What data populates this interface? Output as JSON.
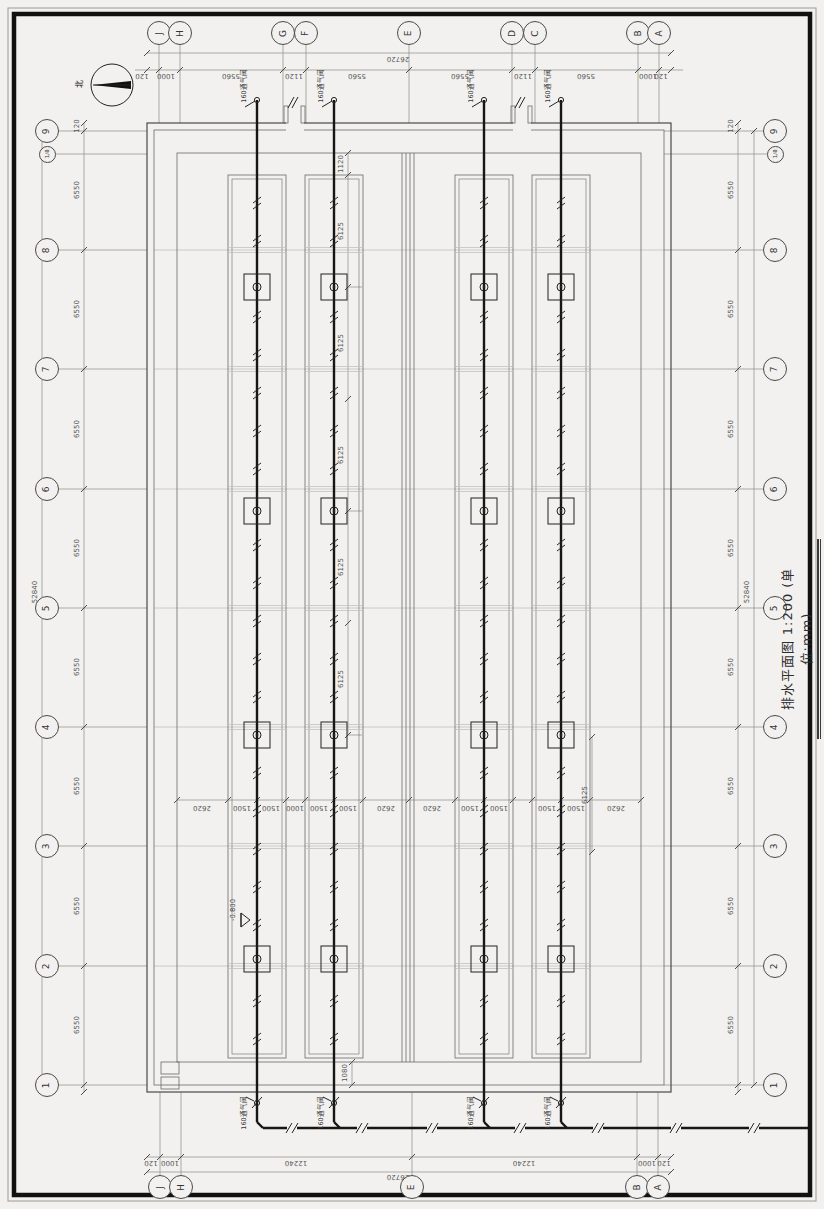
{
  "title": {
    "text": "排水平面图 1:200 (单位:mm)"
  },
  "north": {
    "label": "北"
  },
  "bubbles": {
    "top": [
      {
        "t": "J",
        "x": 159,
        "y": 33
      },
      {
        "t": "H",
        "x": 180,
        "y": 33
      },
      {
        "t": "G",
        "x": 283,
        "y": 33
      },
      {
        "t": "F",
        "x": 306,
        "y": 33
      },
      {
        "t": "E",
        "x": 409,
        "y": 33
      },
      {
        "t": "D",
        "x": 512,
        "y": 33
      },
      {
        "t": "C",
        "x": 535,
        "y": 33
      },
      {
        "t": "B",
        "x": 638,
        "y": 33
      },
      {
        "t": "A",
        "x": 659,
        "y": 33
      }
    ],
    "bottom": [
      {
        "t": "J",
        "x": 160,
        "y": 1187
      },
      {
        "t": "H",
        "x": 181,
        "y": 1187
      },
      {
        "t": "E",
        "x": 412,
        "y": 1187
      },
      {
        "t": "B",
        "x": 637,
        "y": 1187
      },
      {
        "t": "A",
        "x": 658,
        "y": 1187
      }
    ],
    "left": [
      {
        "t": "9",
        "x": 47,
        "y": 131
      },
      {
        "t": "1/8",
        "x": 47,
        "y": 154,
        "s": 1
      },
      {
        "t": "8",
        "x": 47,
        "y": 250
      },
      {
        "t": "7",
        "x": 47,
        "y": 369
      },
      {
        "t": "6",
        "x": 47,
        "y": 489
      },
      {
        "t": "5",
        "x": 47,
        "y": 608
      },
      {
        "t": "4",
        "x": 47,
        "y": 727
      },
      {
        "t": "3",
        "x": 47,
        "y": 846
      },
      {
        "t": "2",
        "x": 47,
        "y": 966
      },
      {
        "t": "1",
        "x": 47,
        "y": 1085
      }
    ],
    "right": [
      {
        "t": "9",
        "x": 775,
        "y": 131
      },
      {
        "t": "1/8",
        "x": 775,
        "y": 154,
        "s": 1
      },
      {
        "t": "8",
        "x": 775,
        "y": 250
      },
      {
        "t": "7",
        "x": 775,
        "y": 369
      },
      {
        "t": "6",
        "x": 775,
        "y": 489
      },
      {
        "t": "5",
        "x": 775,
        "y": 608
      },
      {
        "t": "4",
        "x": 775,
        "y": 727
      },
      {
        "t": "3",
        "x": 775,
        "y": 846
      },
      {
        "t": "2",
        "x": 775,
        "y": 966
      },
      {
        "t": "1",
        "x": 775,
        "y": 1085
      }
    ]
  },
  "dims": {
    "top_chain": [
      {
        "t": "120",
        "x": 142,
        "y": 75
      },
      {
        "t": "1000",
        "x": 166,
        "y": 75
      },
      {
        "t": "5560",
        "x": 231,
        "y": 75
      },
      {
        "t": "1120",
        "x": 294,
        "y": 75
      },
      {
        "t": "5560",
        "x": 357,
        "y": 75
      },
      {
        "t": "5560",
        "x": 460,
        "y": 75
      },
      {
        "t": "1120",
        "x": 523,
        "y": 75
      },
      {
        "t": "5560",
        "x": 586,
        "y": 75
      },
      {
        "t": "1000",
        "x": 648,
        "y": 75
      },
      {
        "t": "120",
        "x": 661,
        "y": 75
      }
    ],
    "top_overall": [
      {
        "t": "26720",
        "x": 398,
        "y": 58
      }
    ],
    "bottom_chain": [
      {
        "t": "120",
        "x": 151,
        "y": 1162
      },
      {
        "t": "1000",
        "x": 170,
        "y": 1162
      },
      {
        "t": "12240",
        "x": 296,
        "y": 1162
      },
      {
        "t": "12240",
        "x": 524,
        "y": 1162
      },
      {
        "t": "1000",
        "x": 647,
        "y": 1162
      },
      {
        "t": "120",
        "x": 664,
        "y": 1162
      }
    ],
    "bottom_overall": [
      {
        "t": "26720",
        "x": 398,
        "y": 1176
      }
    ],
    "left_chain": [
      {
        "t": "120",
        "x": 77,
        "y": 126
      },
      {
        "t": "6550",
        "x": 77,
        "y": 190
      },
      {
        "t": "6550",
        "x": 77,
        "y": 309
      },
      {
        "t": "6550",
        "x": 77,
        "y": 429
      },
      {
        "t": "6550",
        "x": 77,
        "y": 548
      },
      {
        "t": "6550",
        "x": 77,
        "y": 667
      },
      {
        "t": "6550",
        "x": 77,
        "y": 786
      },
      {
        "t": "6550",
        "x": 77,
        "y": 906
      },
      {
        "t": "6550",
        "x": 77,
        "y": 1025
      }
    ],
    "left_overall": [
      {
        "t": "52840",
        "x": 35,
        "y": 592
      }
    ],
    "right_chain": [
      {
        "t": "120",
        "x": 731,
        "y": 126
      },
      {
        "t": "6550",
        "x": 731,
        "y": 190
      },
      {
        "t": "6550",
        "x": 731,
        "y": 309
      },
      {
        "t": "6550",
        "x": 731,
        "y": 429
      },
      {
        "t": "6550",
        "x": 731,
        "y": 548
      },
      {
        "t": "6550",
        "x": 731,
        "y": 667
      },
      {
        "t": "6550",
        "x": 731,
        "y": 786
      },
      {
        "t": "6550",
        "x": 731,
        "y": 906
      },
      {
        "t": "6550",
        "x": 731,
        "y": 1025
      }
    ],
    "right_overall": [
      {
        "t": "52840",
        "x": 747,
        "y": 592
      }
    ],
    "mid_chain": [
      {
        "t": "2620",
        "x": 202,
        "y": 807
      },
      {
        "t": "1500",
        "x": 242,
        "y": 807
      },
      {
        "t": "1500",
        "x": 271,
        "y": 807
      },
      {
        "t": "1000",
        "x": 295,
        "y": 807
      },
      {
        "t": "1500",
        "x": 319,
        "y": 807
      },
      {
        "t": "1500",
        "x": 348,
        "y": 807
      },
      {
        "t": "2620",
        "x": 386,
        "y": 807
      },
      {
        "t": "2620",
        "x": 432,
        "y": 807
      },
      {
        "t": "1500",
        "x": 470,
        "y": 807
      },
      {
        "t": "1500",
        "x": 499,
        "y": 807
      },
      {
        "t": "1500",
        "x": 547,
        "y": 807
      },
      {
        "t": "1500",
        "x": 576,
        "y": 807
      },
      {
        "t": "2620",
        "x": 616,
        "y": 807
      }
    ],
    "interior": [
      {
        "t": "1120",
        "x": 341,
        "y": 164
      },
      {
        "t": "6125",
        "x": 341,
        "y": 231
      },
      {
        "t": "6125",
        "x": 341,
        "y": 343
      },
      {
        "t": "6125",
        "x": 341,
        "y": 455
      },
      {
        "t": "6125",
        "x": 341,
        "y": 567
      },
      {
        "t": "6125",
        "x": 341,
        "y": 679
      },
      {
        "t": "6125",
        "x": 585,
        "y": 795
      }
    ],
    "misc": [
      {
        "t": "1080",
        "x": 345,
        "y": 1073
      }
    ]
  },
  "labels": {
    "vents": [
      {
        "t": "160通气阀",
        "x": 244,
        "y": 86
      },
      {
        "t": "160通气阀",
        "x": 321,
        "y": 86
      },
      {
        "t": "160通气阀",
        "x": 471,
        "y": 86
      },
      {
        "t": "160通气阀",
        "x": 548,
        "y": 86
      },
      {
        "t": "160通气阀",
        "x": 244,
        "y": 1113
      },
      {
        "t": "160通气阀",
        "x": 321,
        "y": 1113
      },
      {
        "t": "160通气阀",
        "x": 471,
        "y": 1113
      },
      {
        "t": "160通气阀",
        "x": 548,
        "y": 1113
      }
    ],
    "elevation": [
      {
        "t": "-0.800",
        "x": 233,
        "y": 910
      }
    ]
  }
}
